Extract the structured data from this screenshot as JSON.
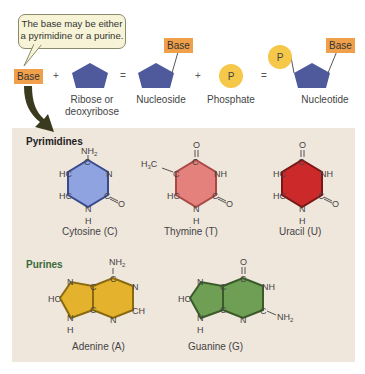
{
  "callout": {
    "line1": "The base may be either",
    "line2": "a pyrimidine or a purine."
  },
  "equation": {
    "base_label": "Base",
    "plus1": "+",
    "sugar_label_line1": "Ribose or",
    "sugar_label_line2": "deoxyribose",
    "equals1": "=",
    "nucleoside_label": "Nucleoside",
    "nucleoside_base": "Base",
    "plus2": "+",
    "phosphate_symbol": "P",
    "phosphate_label": "Phosphate",
    "equals2": "=",
    "nucleotide_label": "Nucleotide",
    "nucleotide_base": "Base",
    "nucleotide_phosphate": "P"
  },
  "colors": {
    "base_orange": "#f0a04a",
    "sugar_blue": "#4e5a9c",
    "phosphate_yellow": "#f5c84a",
    "panel_beige": "#efe6dc",
    "cytosine": "#8fa3e0",
    "thymine": "#e4817d",
    "uracil": "#cc2a2a",
    "adenine": "#e5b22e",
    "guanine": "#6f9e55"
  },
  "pyrimidines": {
    "title": "Pyrimidines",
    "cytosine": {
      "name": "Cytosine (C)",
      "top": "NH2",
      "atoms": [
        "C",
        "N",
        "C",
        "O",
        "N",
        "H",
        "HC",
        "HC"
      ]
    },
    "thymine": {
      "name": "Thymine (T)",
      "top": "O",
      "methyl": "H3C",
      "atoms": [
        "C",
        "NH",
        "C",
        "O",
        "N",
        "H",
        "HC",
        "C"
      ]
    },
    "uracil": {
      "name": "Uracil (U)",
      "top": "O",
      "atoms": [
        "C",
        "NH",
        "C",
        "O",
        "N",
        "H",
        "HC",
        "HC"
      ]
    }
  },
  "purines": {
    "title": "Purines",
    "adenine": {
      "name": "Adenine (A)",
      "top": "NH2",
      "atoms": [
        "N",
        "HC",
        "N",
        "H",
        "C",
        "C",
        "C",
        "N",
        "CH",
        "N"
      ]
    },
    "guanine": {
      "name": "Guanine (G)",
      "top": "O",
      "side": "NH2",
      "atoms": [
        "N",
        "HC",
        "N",
        "H",
        "C",
        "C",
        "C",
        "NH",
        "C",
        "N"
      ]
    }
  }
}
